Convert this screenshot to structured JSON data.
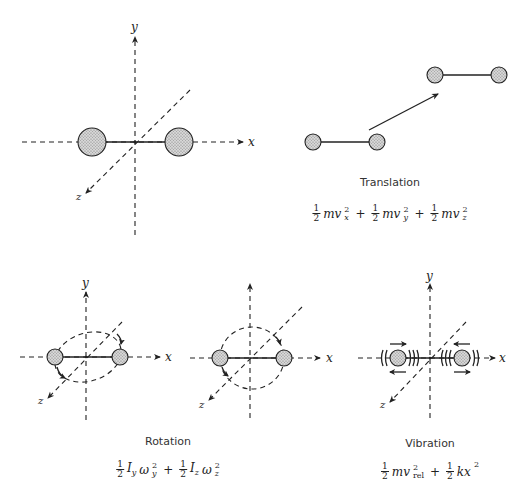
{
  "diagram": {
    "panels": {
      "axes_reference": {
        "axis_labels": {
          "x": "x",
          "y": "y",
          "z": "z"
        },
        "description": "Diatomic molecule centered at origin of x, y, z axes"
      },
      "translation": {
        "caption": "Translation",
        "equation": {
          "terms": [
            {
              "coef_num": "1",
              "coef_den": "2",
              "body": "mv",
              "sup": "2",
              "sub": "x"
            },
            {
              "coef_num": "1",
              "coef_den": "2",
              "body": "mv",
              "sup": "2",
              "sub": "y"
            },
            {
              "coef_num": "1",
              "coef_den": "2",
              "body": "mv",
              "sup": "2",
              "sub": "z"
            }
          ],
          "operator": "+"
        }
      },
      "rotation": {
        "caption": "Rotation",
        "axis_labels": {
          "x": "x",
          "y": "y",
          "z": "z"
        },
        "equation": {
          "terms": [
            {
              "coef_num": "1",
              "coef_den": "2",
              "body": "I",
              "body_sub": "y",
              "body2": "ω",
              "sup": "2",
              "sub": "y"
            },
            {
              "coef_num": "1",
              "coef_den": "2",
              "body": "I",
              "body_sub": "z",
              "body2": "ω",
              "sup": "2",
              "sub": "z"
            }
          ],
          "operator": "+"
        }
      },
      "vibration": {
        "caption": "Vibration",
        "axis_labels": {
          "x": "x",
          "y": "y",
          "z": "z"
        },
        "equation": {
          "terms": [
            {
              "coef_num": "1",
              "coef_den": "2",
              "body": "mv",
              "sup": "2",
              "sub": "rel"
            },
            {
              "coef_num": "1",
              "coef_den": "2",
              "body": "kx",
              "sup": "2",
              "sub": ""
            }
          ],
          "operator": "+"
        }
      }
    }
  }
}
